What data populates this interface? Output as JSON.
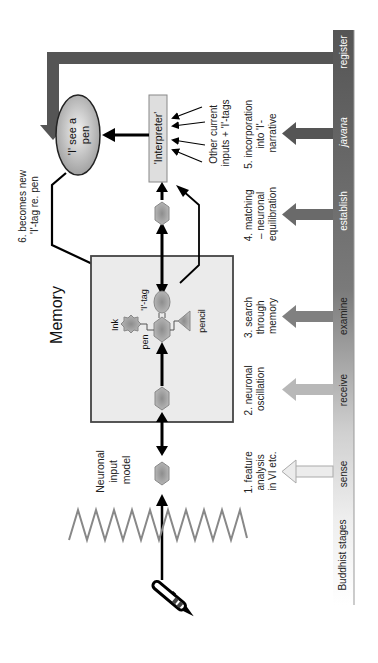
{
  "title": "Memory",
  "stages_bar": {
    "label": "Buddhist stages",
    "stages": [
      "sense",
      "receive",
      "examine",
      "establish",
      "javana",
      "register"
    ]
  },
  "steps": [
    {
      "lines": [
        "1. feature",
        "analysis",
        "in VI etc."
      ]
    },
    {
      "lines": [
        "2. neuronal",
        "oscillation"
      ]
    },
    {
      "lines": [
        "3. search",
        "through",
        "memory"
      ]
    },
    {
      "lines": [
        "4. matching",
        "– neuronal",
        "equilibration"
      ]
    },
    {
      "lines": [
        "5. incorporation",
        "into 'I'-",
        "narrative"
      ]
    },
    {
      "lines": [
        "6. becomes new",
        "'I'-tag re. pen"
      ]
    }
  ],
  "nodes": {
    "input_model": [
      "Neuronal",
      "input",
      "model"
    ],
    "interpreter": "'Interpreter'",
    "i_see_pen": [
      "'I' see a",
      "pen"
    ],
    "other_inputs": [
      "Other current",
      "inputs + 'I'-tags"
    ],
    "ink": "Ink",
    "pen": "pen",
    "i_tag": "'I'-tag",
    "pencil": "pencil"
  },
  "colors": {
    "bar_dark": "#5a5a5a",
    "bar_light": "#e6e6e6",
    "memory_box": "#ececec",
    "node_fill": "#a8a8a8",
    "ellipse_fill": "#c8c8c8"
  }
}
